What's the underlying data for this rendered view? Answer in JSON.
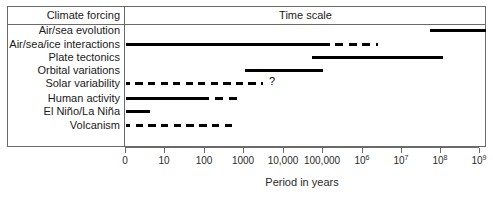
{
  "figure": {
    "header": {
      "left_column": "Climate forcing",
      "right_column": "Time scale"
    },
    "axis_title": "Period in years"
  },
  "chart_data": {
    "type": "bar",
    "title": "Time scale",
    "xlabel": "Period in years",
    "ylabel": "Climate forcing",
    "x_scale": "log-like categorical (0, then decades)",
    "grid": false,
    "legend": null,
    "tick_labels": [
      "0",
      "10",
      "100",
      "1000",
      "10,000",
      "100,000",
      "10⁶",
      "10⁷",
      "10⁸",
      "10⁹"
    ],
    "tick_labels_html": [
      "0",
      "10",
      "100",
      "1000",
      "10,000",
      "100,000",
      "10<sup>6</sup>",
      "10<sup>7</sup>",
      "10<sup>8</sup>",
      "10<sup>9</sup>"
    ],
    "tick_positions_px": [
      125,
      164,
      204,
      243,
      283,
      322,
      362,
      401,
      440,
      479
    ],
    "categories": [
      "Air/sea evolution",
      "Air/sea/ice interactions",
      "Plate tectonics",
      "Orbital variations",
      "Solar variability",
      "Human activity",
      "El Niño/La Niña",
      "Volcanism"
    ],
    "bars": [
      {
        "label": "Air/sea evolution",
        "segments": [
          {
            "style": "solid",
            "start_px": 430,
            "end_px": 486
          }
        ],
        "annotation": null,
        "range_approx": "10⁸ – 10⁹+ years"
      },
      {
        "label": "Air/sea/ice interactions",
        "segments": [
          {
            "style": "solid",
            "start_px": 126,
            "end_px": 325
          },
          {
            "style": "dashed",
            "start_px": 325,
            "end_px": 378
          }
        ],
        "annotation": null,
        "range_approx": "0 – 100,000 years, dashed to ~10⁶"
      },
      {
        "label": "Plate tectonics",
        "segments": [
          {
            "style": "solid",
            "start_px": 312,
            "end_px": 443
          }
        ],
        "annotation": null,
        "range_approx": "~100,000 – 10⁸ years"
      },
      {
        "label": "Orbital variations",
        "segments": [
          {
            "style": "solid",
            "start_px": 245,
            "end_px": 323
          }
        ],
        "annotation": null,
        "range_approx": "~1000 – 100,000 years"
      },
      {
        "label": "Solar variability",
        "segments": [
          {
            "style": "dashed",
            "start_px": 126,
            "end_px": 263
          }
        ],
        "annotation": "?",
        "annotation_x_px": 269,
        "range_approx": "0 – ~2000 years (uncertain)"
      },
      {
        "label": "Human activity",
        "segments": [
          {
            "style": "solid",
            "start_px": 126,
            "end_px": 204
          },
          {
            "style": "dashed",
            "start_px": 204,
            "end_px": 241
          }
        ],
        "annotation": null,
        "range_approx": "0 – 100 years, dashed to ~1000"
      },
      {
        "label": "El Niño/La Niña",
        "segments": [
          {
            "style": "solid",
            "start_px": 126,
            "end_px": 150
          }
        ],
        "annotation": null,
        "range_approx": "0 – ~5 years"
      },
      {
        "label": "Volcanism",
        "segments": [
          {
            "style": "dashed",
            "start_px": 126,
            "end_px": 233
          }
        ],
        "annotation": null,
        "range_approx": "0 – ~300 years"
      }
    ],
    "row_y_px": [
      30,
      44,
      57,
      70,
      83,
      98,
      111,
      125
    ],
    "colors": {
      "bar": "#000000",
      "frame": "#6a6a6a",
      "text": "#1a1a1a",
      "background": "#ffffff"
    }
  }
}
